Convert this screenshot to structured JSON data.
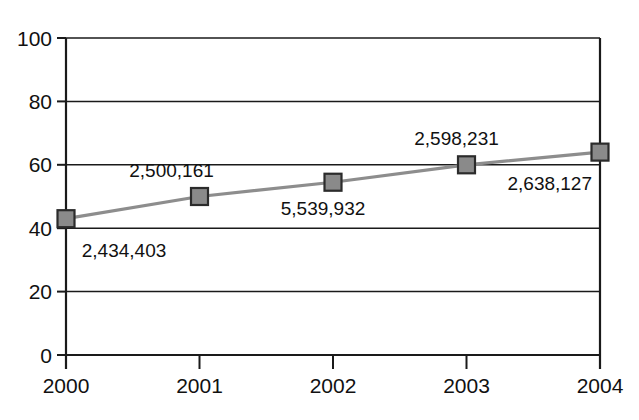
{
  "chart_data": {
    "type": "line",
    "title": "",
    "subtitle": "",
    "xlabel": "",
    "ylabel": "",
    "categories": [
      "2000",
      "2001",
      "2002",
      "2003",
      "2004"
    ],
    "x": [
      2000,
      2001,
      2002,
      2003,
      2004
    ],
    "values": [
      43,
      50,
      54.5,
      60,
      64
    ],
    "point_labels": [
      "2,434,403",
      "2,500,161",
      "5,539,932",
      "2,598,231",
      "2,638,127"
    ],
    "point_label_positions": [
      "below",
      "above",
      "below",
      "above",
      "below"
    ],
    "ylim": [
      0,
      100
    ],
    "ytick_labels": [
      "0",
      "20",
      "40",
      "60",
      "80",
      "100"
    ],
    "ytick_values": [
      0,
      20,
      40,
      60,
      80,
      100
    ],
    "xtick_labels": [
      "2000",
      "2001",
      "2002",
      "2003",
      "2004"
    ],
    "grid": "horizontal",
    "legend": "none",
    "series": [
      {
        "name": "series-1",
        "values": [
          43,
          50,
          54.5,
          60,
          64
        ],
        "labels": [
          "2,434,403",
          "2,500,161",
          "5,539,932",
          "2,598,231",
          "2,638,127"
        ],
        "marker": "square",
        "marker_color": "#8a8a8a",
        "marker_border_color": "#2b2b2b",
        "line_color": "#8d8d8d"
      }
    ],
    "colors": {
      "background": "#ffffff",
      "axis": "#1a1a1a",
      "grid": "#1a1a1a",
      "line": "#8d8d8d",
      "marker_fill": "#8a8a8a",
      "marker_stroke": "#2b2b2b",
      "text": "#111111"
    }
  },
  "geometry": {
    "plot_left": 66,
    "plot_right": 600,
    "plot_top": 38,
    "plot_bottom": 355
  }
}
